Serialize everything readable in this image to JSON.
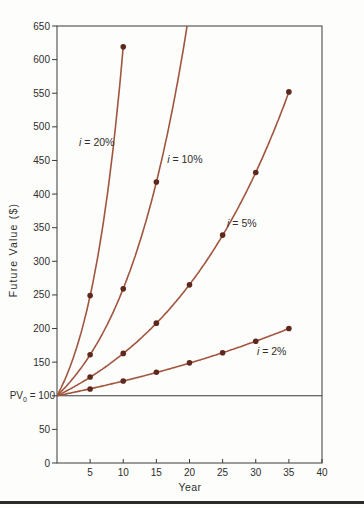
{
  "figure": {
    "background": "#fdfdfb",
    "bottom_rule_color": "#2b2b2b"
  },
  "chart_data": {
    "type": "line",
    "title": "",
    "xlabel": "Year",
    "ylabel": "Future Value ($)",
    "xlim": [
      0,
      40
    ],
    "ylim": [
      0,
      650
    ],
    "x_ticks": [
      5,
      10,
      15,
      20,
      25,
      30,
      35,
      40
    ],
    "y_ticks": [
      0,
      50,
      100,
      150,
      200,
      250,
      300,
      350,
      400,
      450,
      500,
      550,
      600,
      650
    ],
    "grid": false,
    "legend": "inline-curve-labels",
    "reference_line": {
      "y": 100,
      "label_base": "PV",
      "label_sub": "0",
      "label_rest": " = 100"
    },
    "series": [
      {
        "name": "i = 20%",
        "rate": 0.2,
        "x": [
          0,
          5,
          10
        ],
        "y": [
          100,
          249,
          619
        ],
        "extends_beyond_top": false,
        "label": {
          "text": "i = 20%",
          "x": 6.0,
          "y": 477
        }
      },
      {
        "name": "i = 10%",
        "rate": 0.1,
        "x": [
          0,
          5,
          10,
          15
        ],
        "y": [
          100,
          161,
          259,
          418
        ],
        "extends_beyond_top": true,
        "label": {
          "text": "i = 10%",
          "x": 19.3,
          "y": 452
        }
      },
      {
        "name": "i = 5%",
        "rate": 0.05,
        "x": [
          0,
          5,
          10,
          15,
          20,
          25,
          30,
          35
        ],
        "y": [
          100,
          128,
          163,
          208,
          265,
          339,
          432,
          552
        ],
        "extends_beyond_top": false,
        "label": {
          "text": "i = 5%",
          "x": 27.9,
          "y": 356
        }
      },
      {
        "name": "i = 2%",
        "rate": 0.02,
        "x": [
          0,
          5,
          10,
          15,
          20,
          25,
          30,
          35
        ],
        "y": [
          100,
          110,
          122,
          135,
          149,
          164,
          181,
          200
        ],
        "extends_beyond_top": false,
        "label": {
          "text": "i = 2%",
          "x": 32.4,
          "y": 166
        }
      }
    ],
    "colors": {
      "line": "#a0553f",
      "marker": "#5e281c",
      "axis": "#3a3a3a",
      "text": "#2e2e2e"
    }
  }
}
